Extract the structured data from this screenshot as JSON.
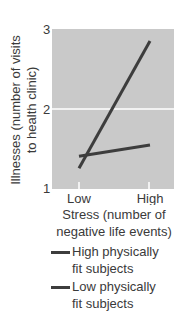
{
  "chart_data": {
    "type": "line",
    "title": "",
    "xlabel": "Stress (number of negative life events)",
    "ylabel": "Illnesses (number of visits to health clinic)",
    "ylabel_lines": [
      "Illnesses (number of visits",
      "to health clinic)"
    ],
    "xlabel_lines": [
      "Stress (number of",
      "negative life events)"
    ],
    "categories": [
      "Low",
      "High"
    ],
    "ylim": [
      1,
      3
    ],
    "yticks": [
      1,
      2,
      3
    ],
    "grid": "horizontal line at 2",
    "legend_position": "below",
    "series": [
      {
        "name": "High physically fit subjects",
        "legend_lines": [
          "High physically",
          "fit subjects"
        ],
        "values": [
          1.41,
          1.55
        ],
        "color": "#3d3d3d"
      },
      {
        "name": "Low physically fit subjects",
        "legend_lines": [
          "Low physically",
          "fit subjects"
        ],
        "values": [
          1.26,
          2.85
        ],
        "color": "#3d3d3d"
      }
    ],
    "plot_background": "#c9c9c9"
  }
}
